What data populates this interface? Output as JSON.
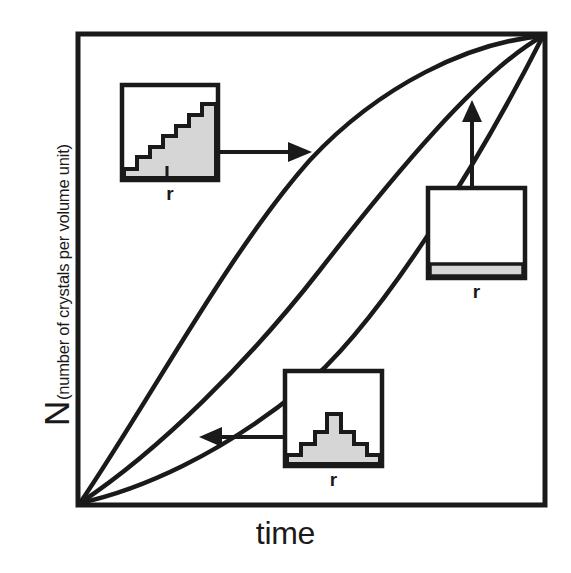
{
  "figure": {
    "title": "",
    "axes": {
      "y_label_main": "N",
      "y_label_sub": "(number of crystals per volume unit)",
      "x_label": "time",
      "frame": {
        "left": 78,
        "top": 34,
        "right": 545,
        "bottom": 505
      },
      "frame_stroke": "#1a1a1a",
      "frame_width": 5
    },
    "insets": [
      {
        "id": "inset-staircase",
        "name": "crystal-size-distribution-staircase",
        "r_label": "r",
        "box": {
          "x": 122,
          "y": 85,
          "w": 96,
          "h": 95
        },
        "description": "ascending staircase size distribution",
        "histogram_type": "staircase",
        "bars": [
          0.1,
          0.1,
          0.22,
          0.22,
          0.34,
          0.34,
          0.46,
          0.46,
          0.58,
          0.58,
          0.7,
          0.7,
          0.82,
          0.9
        ],
        "tick_x_frac": 0.47
      },
      {
        "id": "inset-flat",
        "name": "crystal-size-distribution-flat",
        "r_label": "r",
        "box": {
          "x": 428,
          "y": 188,
          "w": 97,
          "h": 90
        },
        "description": "uniform thin flat size distribution",
        "histogram_type": "flat",
        "bars": [
          0.13,
          0.13,
          0.13,
          0.13,
          0.13,
          0.13,
          0.13,
          0.13,
          0.13,
          0.13,
          0.13,
          0.13
        ]
      },
      {
        "id": "inset-bell",
        "name": "crystal-size-distribution-bell",
        "r_label": "r",
        "box": {
          "x": 285,
          "y": 371,
          "w": 97,
          "h": 95
        },
        "description": "symmetric bell shaped size distribution",
        "histogram_type": "bell",
        "bars": [
          0.09,
          0.09,
          0.2,
          0.2,
          0.33,
          0.33,
          0.52,
          0.52,
          0.33,
          0.33,
          0.2,
          0.2,
          0.09,
          0.09
        ]
      }
    ],
    "curves": [
      {
        "id": "curve-upper",
        "name": "nucleation-curve-fast",
        "description": "strongly concave-down growth curve reaching plateau earliest"
      },
      {
        "id": "curve-middle",
        "name": "nucleation-curve-intermediate",
        "description": "sigmoid growth curve crossing the others mid-plot"
      },
      {
        "id": "curve-lower",
        "name": "nucleation-curve-slow",
        "description": "concave-up growth curve rising late"
      }
    ],
    "arrows": [
      {
        "id": "arrow-top",
        "name": "arrow-staircase-to-upper-curve",
        "direction": "right",
        "from": [
          219,
          152
        ],
        "to": [
          302,
          152
        ]
      },
      {
        "id": "arrow-right",
        "name": "arrow-flat-to-upper-curve",
        "direction": "up",
        "from": [
          472,
          188
        ],
        "to": [
          472,
          106
        ]
      },
      {
        "id": "arrow-bottom",
        "name": "arrow-bell-to-lower-curve",
        "direction": "left",
        "from": [
          285,
          437
        ],
        "to": [
          205,
          437
        ]
      }
    ],
    "colors": {
      "line": "#1a1a1a",
      "fill_gray": "#d6d6d6",
      "background": "#ffffff"
    }
  }
}
